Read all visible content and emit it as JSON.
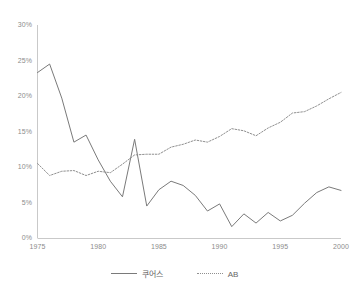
{
  "chart_data": {
    "type": "line",
    "title": "",
    "subtitle": "",
    "xlabel": "",
    "ylabel": "",
    "xlim": [
      1975,
      2000
    ],
    "ylim": [
      0,
      30
    ],
    "grid": false,
    "legend_position": "bottom",
    "x": [
      1975,
      1976,
      1977,
      1978,
      1979,
      1980,
      1981,
      1982,
      1983,
      1984,
      1985,
      1986,
      1987,
      1988,
      1989,
      1990,
      1991,
      1992,
      1993,
      1994,
      1995,
      1996,
      1997,
      1998,
      1999,
      2000
    ],
    "x_tick_labels": [
      "1975",
      "1980",
      "1985",
      "1990",
      "1995",
      "2000"
    ],
    "x_ticks": [
      1975,
      1980,
      1985,
      1990,
      1995,
      2000
    ],
    "y_tick_labels": [
      "0%",
      "5%",
      "10%",
      "15%",
      "20%",
      "25%",
      "30%"
    ],
    "y_ticks": [
      0,
      5,
      10,
      15,
      20,
      25,
      30
    ],
    "series": [
      {
        "name": "쿠어스",
        "style": "solid",
        "color": "#7a7a7a",
        "values": [
          23.3,
          24.5,
          19.7,
          13.5,
          14.5,
          11.0,
          8.0,
          5.8,
          13.9,
          4.5,
          6.8,
          8.0,
          7.4,
          6.0,
          3.8,
          4.8,
          1.6,
          3.4,
          2.1,
          3.6,
          2.4,
          3.2,
          4.9,
          6.4,
          7.2,
          6.7
        ]
      },
      {
        "name": "AB",
        "style": "dotted",
        "color": "#8f8f8f",
        "values": [
          10.5,
          8.8,
          9.4,
          9.5,
          8.8,
          9.4,
          9.2,
          10.4,
          11.7,
          11.8,
          11.8,
          12.8,
          13.2,
          13.8,
          13.5,
          14.3,
          15.4,
          15.1,
          14.4,
          15.5,
          16.3,
          17.6,
          17.8,
          18.6,
          19.6,
          20.5
        ]
      }
    ]
  },
  "axis": {
    "y_color": "#c9c9c9",
    "x_color": "#c9c9c9",
    "tick_color": "#8c8c8c"
  }
}
